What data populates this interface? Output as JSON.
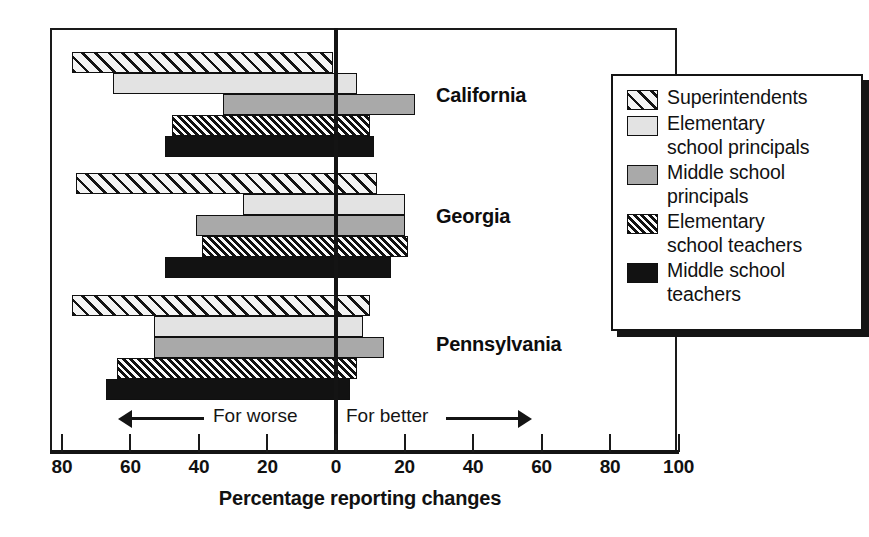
{
  "chart_data": {
    "type": "bar",
    "title": "",
    "xlabel": "Percentage reporting changes",
    "ylabel": "",
    "orientation": "horizontal",
    "grid": false,
    "xlim": [
      -80,
      100
    ],
    "xticks": [
      -80,
      -60,
      -40,
      -20,
      0,
      20,
      40,
      60,
      80,
      100
    ],
    "xticklabels": [
      "80",
      "60",
      "40",
      "20",
      "0",
      "20",
      "40",
      "60",
      "80",
      "100"
    ],
    "categories": [
      "California",
      "Georgia",
      "Pennsylvania"
    ],
    "legend_position": "right",
    "annotations": [
      {
        "text": "For worse",
        "side": "left",
        "arrow": "left"
      },
      {
        "text": "For better",
        "side": "right",
        "arrow": "right"
      }
    ],
    "series": [
      {
        "name": "Superintendents",
        "pattern": "diagonal-hatch-wide",
        "color": "#f2f2f2",
        "negative": [
          -77,
          -76,
          -77
        ],
        "positive": [
          -1,
          12,
          10
        ]
      },
      {
        "name": "Elementary school principals",
        "pattern": "solid-light-gray",
        "color": "#e3e3e3",
        "negative": [
          -65,
          -27,
          -53
        ],
        "positive": [
          6,
          20,
          8
        ]
      },
      {
        "name": "Middle school principals",
        "pattern": "solid-medium-gray",
        "color": "#a9a9a9",
        "negative": [
          -33,
          -41,
          -53
        ],
        "positive": [
          23,
          20,
          14
        ]
      },
      {
        "name": "Elementary school teachers",
        "pattern": "diagonal-hatch-dense",
        "color": "#f4f4f4",
        "negative": [
          -48,
          -39,
          -64
        ],
        "positive": [
          10,
          21,
          6
        ]
      },
      {
        "name": "Middle school teachers",
        "pattern": "solid-black",
        "color": "#121212",
        "negative": [
          -50,
          -50,
          -67
        ],
        "positive": [
          11,
          16,
          4
        ]
      }
    ]
  },
  "axis": {
    "title": "Percentage reporting changes",
    "tick_labels": [
      "80",
      "60",
      "40",
      "20",
      "0",
      "20",
      "40",
      "60",
      "80",
      "100"
    ]
  },
  "direction": {
    "worse": "For worse",
    "better": "For better"
  },
  "groups": [
    {
      "label": "California"
    },
    {
      "label": "Georgia"
    },
    {
      "label": "Pennsylvania"
    }
  ],
  "legend": {
    "items": [
      {
        "label": "Superintendents",
        "swatch": "diagonal-hatch-wide"
      },
      {
        "label": "Elementary\nschool principals",
        "swatch": "solid-light-gray"
      },
      {
        "label": "Middle school\nprincipals",
        "swatch": "solid-medium-gray"
      },
      {
        "label": "Elementary\nschool teachers",
        "swatch": "diagonal-hatch-dense"
      },
      {
        "label": "Middle school\nteachers",
        "swatch": "solid-black"
      }
    ]
  }
}
